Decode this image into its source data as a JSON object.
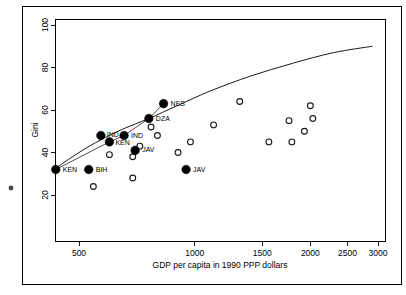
{
  "chart_data": {
    "type": "scatter",
    "title": "",
    "xlabel": "GDP per capita in 1990 PPP dollars",
    "ylabel": "Gini",
    "xscale": "log",
    "xlim": [
      400,
      3200
    ],
    "ylim": [
      14,
      104
    ],
    "xticks": [
      500,
      1000,
      1500,
      2000,
      2500,
      3000
    ],
    "xtick_labels": [
      "500",
      "1000",
      "1500",
      "2000",
      "2500",
      "3000"
    ],
    "yticks": [
      20,
      40,
      60,
      80,
      100
    ],
    "ytick_labels": [
      "20",
      "40",
      "60",
      "80",
      "100"
    ],
    "grid": false,
    "legend": "none",
    "series": [
      {
        "name": "labeled-observations",
        "marker": "filled-circle",
        "points": [
          {
            "label": "KEN",
            "x": 435,
            "y": 32,
            "label_dx": 7,
            "label_dy": 2.5
          },
          {
            "label": "BIH",
            "x": 530,
            "y": 32,
            "label_dx": 7,
            "label_dy": 2.5
          },
          {
            "label": "IND",
            "x": 570,
            "y": 48,
            "label_dx": 6,
            "label_dy": 1
          },
          {
            "label": "KEN",
            "x": 600,
            "y": 45,
            "label_dx": 6,
            "label_dy": 3
          },
          {
            "label": "IND",
            "x": 655,
            "y": 48,
            "label_dx": 7,
            "label_dy": 2
          },
          {
            "label": "JAV",
            "x": 700,
            "y": 41,
            "label_dx": 7,
            "label_dy": 2
          },
          {
            "label": "DZA",
            "x": 760,
            "y": 56,
            "label_dx": 7,
            "label_dy": 2
          },
          {
            "label": "NES",
            "x": 830,
            "y": 63,
            "label_dx": 7,
            "label_dy": 2
          },
          {
            "label": "JAV",
            "x": 950,
            "y": 32,
            "label_dx": 7,
            "label_dy": 2
          }
        ]
      },
      {
        "name": "unlabeled-observations",
        "marker": "open-circle",
        "points": [
          {
            "x": 545,
            "y": 24
          },
          {
            "x": 600,
            "y": 39
          },
          {
            "x": 690,
            "y": 28
          },
          {
            "x": 690,
            "y": 38
          },
          {
            "x": 720,
            "y": 43
          },
          {
            "x": 770,
            "y": 52
          },
          {
            "x": 800,
            "y": 48
          },
          {
            "x": 905,
            "y": 40
          },
          {
            "x": 975,
            "y": 45
          },
          {
            "x": 1120,
            "y": 53
          },
          {
            "x": 1310,
            "y": 64
          },
          {
            "x": 1560,
            "y": 45
          },
          {
            "x": 1760,
            "y": 55
          },
          {
            "x": 1790,
            "y": 45
          },
          {
            "x": 1930,
            "y": 50
          },
          {
            "x": 2000,
            "y": 62
          },
          {
            "x": 2030,
            "y": 56
          }
        ]
      }
    ],
    "trend_curve": {
      "name": "fitted-kuznets-curve",
      "points": [
        {
          "x": 430,
          "y": 32
        },
        {
          "x": 500,
          "y": 40
        },
        {
          "x": 570,
          "y": 46
        },
        {
          "x": 650,
          "y": 51
        },
        {
          "x": 760,
          "y": 56
        },
        {
          "x": 900,
          "y": 62
        },
        {
          "x": 1100,
          "y": 69
        },
        {
          "x": 1400,
          "y": 76
        },
        {
          "x": 1800,
          "y": 82
        },
        {
          "x": 2300,
          "y": 87
        },
        {
          "x": 2900,
          "y": 90
        }
      ]
    },
    "annotations": [
      {
        "name": "stray-mark",
        "x_px": 11,
        "y_px": 188
      }
    ]
  }
}
